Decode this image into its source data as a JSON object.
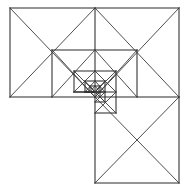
{
  "figure": {
    "canvas": {
      "width": 189,
      "height": 193,
      "background_color": "#ffffff"
    },
    "style": {
      "stroke_color": "#3a3a3a",
      "stroke_color_heavy": "#2b2b2b",
      "stroke_width": 0.9,
      "stroke_width_heavy": 1.05,
      "fill": "none"
    },
    "bounds": {
      "left": 10,
      "top": 8,
      "right": 179,
      "bottom": 183,
      "mid_x": 95,
      "mid_y": 97
    },
    "labels": [],
    "axis_ticks": [],
    "legend": []
  },
  "chart_data": {
    "type": "diagram",
    "xlabel": "",
    "ylabel": "",
    "xlim": [
      0,
      189
    ],
    "ylim": [
      0,
      193
    ],
    "grid": false,
    "legend_position": "none",
    "vertices": {
      "outer_top_left": [
        10,
        8
      ],
      "outer_top_mid": [
        95,
        8
      ],
      "outer_top_right": [
        179,
        8
      ],
      "outer_left_bottom": [
        10,
        97
      ],
      "centre": [
        95,
        97
      ],
      "outer_right_mid": [
        179,
        97
      ],
      "bottom_left": [
        95,
        183
      ],
      "bottom_right": [
        179,
        183
      ],
      "inner_a": [
        52,
        50
      ],
      "inner_b": [
        137,
        50
      ],
      "inner_c": [
        116,
        71
      ],
      "inner_d": [
        74,
        71
      ],
      "inner_e": [
        116,
        113
      ],
      "inner_f": [
        74,
        92
      ],
      "inner_g": [
        105,
        81
      ],
      "inner_h": [
        85,
        81
      ],
      "inner_i": [
        105,
        102
      ],
      "inner_j": [
        85,
        92
      ],
      "inner_k": [
        100,
        86
      ],
      "inner_l": [
        90,
        86
      ],
      "inner_m": [
        100,
        97
      ],
      "inner_n": [
        90,
        92
      ]
    },
    "shapes": [
      {
        "name": "top-left-rectangle",
        "kind": "rect-with-diagonals",
        "points": [
          [
            10,
            8
          ],
          [
            95,
            8
          ],
          [
            95,
            97
          ],
          [
            10,
            97
          ]
        ]
      },
      {
        "name": "top-right-square",
        "kind": "square-with-diagonals",
        "points": [
          [
            95,
            8
          ],
          [
            179,
            8
          ],
          [
            179,
            97
          ],
          [
            95,
            97
          ]
        ]
      },
      {
        "name": "bottom-right-square",
        "kind": "square-with-diagonals",
        "points": [
          [
            95,
            97
          ],
          [
            179,
            97
          ],
          [
            179,
            183
          ],
          [
            95,
            183
          ]
        ]
      },
      {
        "name": "recursion-level-1",
        "kind": "square-with-diagonals",
        "points": [
          [
            52,
            50
          ],
          [
            137,
            50
          ],
          [
            137,
            97
          ],
          [
            52,
            97
          ]
        ]
      },
      {
        "name": "recursion-level-2",
        "kind": "square-with-diagonals",
        "points": [
          [
            74,
            71
          ],
          [
            116,
            71
          ],
          [
            116,
            113
          ],
          [
            74,
            113
          ]
        ]
      },
      {
        "name": "recursion-level-3",
        "kind": "square-with-diagonals",
        "points": [
          [
            85,
            81
          ],
          [
            105,
            81
          ],
          [
            105,
            102
          ],
          [
            85,
            102
          ]
        ]
      },
      {
        "name": "recursion-level-4",
        "kind": "square-with-diagonals",
        "points": [
          [
            90,
            86
          ],
          [
            100,
            86
          ],
          [
            100,
            97
          ],
          [
            90,
            97
          ]
        ]
      }
    ],
    "segments": [
      {
        "name": "outer-top-edge",
        "from": [
          10,
          8
        ],
        "to": [
          179,
          8
        ]
      },
      {
        "name": "outer-left-edge",
        "from": [
          10,
          8
        ],
        "to": [
          10,
          97
        ]
      },
      {
        "name": "outer-right-edge-upper",
        "from": [
          179,
          8
        ],
        "to": [
          179,
          97
        ]
      },
      {
        "name": "outer-right-edge-lower",
        "from": [
          179,
          97
        ],
        "to": [
          179,
          183
        ]
      },
      {
        "name": "outer-bottom-edge",
        "from": [
          95,
          183
        ],
        "to": [
          179,
          183
        ]
      },
      {
        "name": "left-bottom-edge",
        "from": [
          10,
          97
        ],
        "to": [
          95,
          97
        ]
      },
      {
        "name": "mid-horizontal-right",
        "from": [
          95,
          97
        ],
        "to": [
          179,
          97
        ]
      },
      {
        "name": "central-vertical",
        "from": [
          95,
          8
        ],
        "to": [
          95,
          183
        ]
      },
      {
        "name": "level1-top",
        "from": [
          52,
          50
        ],
        "to": [
          137,
          50
        ]
      },
      {
        "name": "level1-left",
        "from": [
          52,
          50
        ],
        "to": [
          52,
          97
        ]
      },
      {
        "name": "level1-right",
        "from": [
          137,
          50
        ],
        "to": [
          137,
          97
        ]
      },
      {
        "name": "level2-top",
        "from": [
          74,
          71
        ],
        "to": [
          116,
          71
        ]
      },
      {
        "name": "level2-left",
        "from": [
          74,
          71
        ],
        "to": [
          74,
          92
        ]
      },
      {
        "name": "level2-right",
        "from": [
          116,
          71
        ],
        "to": [
          116,
          113
        ]
      },
      {
        "name": "level2-bottom",
        "from": [
          95,
          113
        ],
        "to": [
          116,
          113
        ]
      },
      {
        "name": "level3-top",
        "from": [
          85,
          81
        ],
        "to": [
          105,
          81
        ]
      },
      {
        "name": "level3-left",
        "from": [
          85,
          81
        ],
        "to": [
          85,
          92
        ]
      },
      {
        "name": "level3-right",
        "from": [
          105,
          81
        ],
        "to": [
          105,
          102
        ]
      },
      {
        "name": "level3-bottom",
        "from": [
          95,
          102
        ],
        "to": [
          105,
          102
        ]
      },
      {
        "name": "level4-top",
        "from": [
          90,
          86
        ],
        "to": [
          100,
          86
        ]
      },
      {
        "name": "level4-left",
        "from": [
          90,
          86
        ],
        "to": [
          90,
          92
        ]
      },
      {
        "name": "level4-right",
        "from": [
          100,
          86
        ],
        "to": [
          100,
          97
        ]
      },
      {
        "name": "mid-horizontal-left-stub",
        "from": [
          74,
          92
        ],
        "to": [
          95,
          92
        ]
      },
      {
        "name": "level3-mid-stub",
        "from": [
          85,
          92
        ],
        "to": [
          95,
          92
        ]
      }
    ],
    "diagonals": [
      {
        "name": "tl-rect-diag-a",
        "from": [
          10,
          8
        ],
        "to": [
          95,
          97
        ]
      },
      {
        "name": "tl-rect-diag-b",
        "from": [
          95,
          8
        ],
        "to": [
          10,
          97
        ]
      },
      {
        "name": "tr-square-diag-a",
        "from": [
          95,
          8
        ],
        "to": [
          179,
          97
        ]
      },
      {
        "name": "tr-square-diag-b",
        "from": [
          179,
          8
        ],
        "to": [
          95,
          97
        ]
      },
      {
        "name": "br-square-diag-a",
        "from": [
          95,
          97
        ],
        "to": [
          179,
          183
        ]
      },
      {
        "name": "br-square-diag-b",
        "from": [
          179,
          97
        ],
        "to": [
          95,
          183
        ]
      },
      {
        "name": "l1-diag-a",
        "from": [
          52,
          50
        ],
        "to": [
          95,
          97
        ]
      },
      {
        "name": "l1-diag-b",
        "from": [
          95,
          50
        ],
        "to": [
          52,
          97
        ]
      },
      {
        "name": "l1-diag-c",
        "from": [
          95,
          50
        ],
        "to": [
          137,
          97
        ]
      },
      {
        "name": "l1-diag-d",
        "from": [
          137,
          50
        ],
        "to": [
          95,
          97
        ]
      },
      {
        "name": "l2-diag-a",
        "from": [
          74,
          71
        ],
        "to": [
          95,
          92
        ]
      },
      {
        "name": "l2-diag-b",
        "from": [
          95,
          71
        ],
        "to": [
          74,
          92
        ]
      },
      {
        "name": "l2-diag-c",
        "from": [
          95,
          71
        ],
        "to": [
          116,
          92
        ]
      },
      {
        "name": "l2-diag-d",
        "from": [
          116,
          71
        ],
        "to": [
          95,
          92
        ]
      },
      {
        "name": "l2-diag-e",
        "from": [
          95,
          92
        ],
        "to": [
          116,
          113
        ]
      },
      {
        "name": "l2-diag-f",
        "from": [
          116,
          92
        ],
        "to": [
          95,
          113
        ]
      },
      {
        "name": "l3-diag-a",
        "from": [
          85,
          81
        ],
        "to": [
          95,
          92
        ]
      },
      {
        "name": "l3-diag-b",
        "from": [
          95,
          81
        ],
        "to": [
          85,
          92
        ]
      },
      {
        "name": "l3-diag-c",
        "from": [
          95,
          81
        ],
        "to": [
          105,
          92
        ]
      },
      {
        "name": "l3-diag-d",
        "from": [
          105,
          81
        ],
        "to": [
          95,
          92
        ]
      },
      {
        "name": "l3-diag-e",
        "from": [
          95,
          92
        ],
        "to": [
          105,
          102
        ]
      },
      {
        "name": "l3-diag-f",
        "from": [
          105,
          92
        ],
        "to": [
          95,
          102
        ]
      },
      {
        "name": "l4-diag-a",
        "from": [
          90,
          86
        ],
        "to": [
          95,
          92
        ]
      },
      {
        "name": "l4-diag-b",
        "from": [
          95,
          86
        ],
        "to": [
          90,
          92
        ]
      },
      {
        "name": "l4-diag-c",
        "from": [
          95,
          86
        ],
        "to": [
          100,
          92
        ]
      },
      {
        "name": "l4-diag-d",
        "from": [
          100,
          86
        ],
        "to": [
          95,
          92
        ]
      },
      {
        "name": "l4-diag-e",
        "from": [
          95,
          92
        ],
        "to": [
          100,
          97
        ]
      },
      {
        "name": "l4-diag-f",
        "from": [
          100,
          92
        ],
        "to": [
          95,
          97
        ]
      }
    ],
    "horizontal_rules": [
      {
        "name": "h-level2-mid",
        "from": [
          74,
          92
        ],
        "to": [
          116,
          92
        ]
      },
      {
        "name": "h-level3-mid",
        "from": [
          85,
          92
        ],
        "to": [
          105,
          92
        ]
      },
      {
        "name": "h-level4-mid",
        "from": [
          90,
          92
        ],
        "to": [
          100,
          92
        ]
      }
    ]
  }
}
